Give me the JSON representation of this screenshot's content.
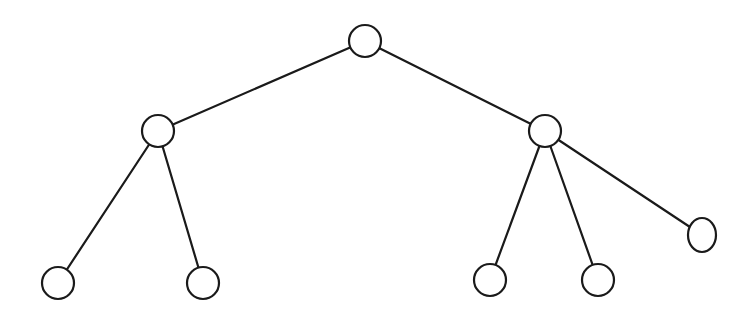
{
  "diagram": {
    "type": "tree",
    "background": "#ffffff",
    "stroke_color": "#1a1a1a",
    "nodes": [
      {
        "id": "root",
        "label": "",
        "cx": 365,
        "cy": 41,
        "rx": 16,
        "ry": 16
      },
      {
        "id": "left",
        "label": "",
        "cx": 158,
        "cy": 131,
        "rx": 16,
        "ry": 16
      },
      {
        "id": "right",
        "label": "",
        "cx": 545,
        "cy": 131,
        "rx": 16,
        "ry": 16
      },
      {
        "id": "left-leaf-1",
        "label": "",
        "cx": 58,
        "cy": 283,
        "rx": 16,
        "ry": 16
      },
      {
        "id": "left-leaf-2",
        "label": "",
        "cx": 203,
        "cy": 283,
        "rx": 16,
        "ry": 16
      },
      {
        "id": "right-leaf-1",
        "label": "",
        "cx": 490,
        "cy": 280,
        "rx": 16,
        "ry": 16
      },
      {
        "id": "right-leaf-2",
        "label": "",
        "cx": 598,
        "cy": 280,
        "rx": 16,
        "ry": 16
      },
      {
        "id": "right-leaf-3",
        "label": "",
        "cx": 702,
        "cy": 235,
        "rx": 14,
        "ry": 17
      }
    ],
    "edges": [
      {
        "from": "root",
        "to": "left"
      },
      {
        "from": "root",
        "to": "right"
      },
      {
        "from": "left",
        "to": "left-leaf-1"
      },
      {
        "from": "left",
        "to": "left-leaf-2"
      },
      {
        "from": "right",
        "to": "right-leaf-1"
      },
      {
        "from": "right",
        "to": "right-leaf-2"
      },
      {
        "from": "right",
        "to": "right-leaf-3"
      }
    ]
  }
}
